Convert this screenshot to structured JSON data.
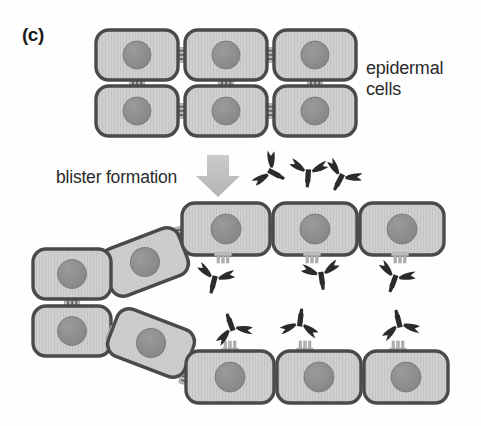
{
  "figure": {
    "panel_label": "(c)",
    "labels": {
      "epidermal_cells_line1": "epidermal",
      "epidermal_cells_line2": "cells",
      "blister_formation": "blister formation"
    },
    "colors": {
      "cell_fill": "#c9c9c9",
      "cell_fill_light": "#d4d4d4",
      "cell_border": "#4a4a4a",
      "nucleus": "#8f8f8f",
      "nucleus_border": "#7a7a7a",
      "desmosome": "#b5b5b5",
      "desmosome_stripe": "#6e6e6e",
      "antibody": "#2b2b2b",
      "arrow": "#c0c0c0",
      "text": "#2a2a2a",
      "background": "#ffffff"
    },
    "arrow": {
      "name": "blister-formation-arrow",
      "direction": "down"
    },
    "intact_cells": [
      {
        "id": "top-row1-cell1",
        "x": 96,
        "y": 30,
        "w": 82,
        "h": 50,
        "rot": 0
      },
      {
        "id": "top-row1-cell2",
        "x": 185,
        "y": 30,
        "w": 82,
        "h": 50,
        "rot": 0
      },
      {
        "id": "top-row1-cell3",
        "x": 274,
        "y": 30,
        "w": 82,
        "h": 50,
        "rot": 0
      },
      {
        "id": "top-row2-cell1",
        "x": 96,
        "y": 86,
        "w": 82,
        "h": 50,
        "rot": 0
      },
      {
        "id": "top-row2-cell2",
        "x": 185,
        "y": 86,
        "w": 82,
        "h": 50,
        "rot": 0
      },
      {
        "id": "top-row2-cell3",
        "x": 274,
        "y": 86,
        "w": 82,
        "h": 50,
        "rot": 0
      }
    ],
    "blister_upper_cells": [
      {
        "id": "upper-tilt-cell",
        "x": 104,
        "y": 237,
        "w": 82,
        "h": 50,
        "rot": -21
      },
      {
        "id": "upper-flat-cell1",
        "x": 182,
        "y": 203,
        "w": 88,
        "h": 52,
        "rot": 0
      },
      {
        "id": "upper-flat-cell2",
        "x": 273,
        "y": 203,
        "w": 84,
        "h": 52,
        "rot": 0
      },
      {
        "id": "upper-flat-cell3",
        "x": 360,
        "y": 203,
        "w": 84,
        "h": 52,
        "rot": 0
      }
    ],
    "blister_left_cells": [
      {
        "id": "left-upper-cell",
        "x": 33,
        "y": 249,
        "w": 78,
        "h": 50,
        "rot": 0
      },
      {
        "id": "left-lower-cell",
        "x": 33,
        "y": 306,
        "w": 78,
        "h": 50,
        "rot": 0
      }
    ],
    "blister_lower_cells": [
      {
        "id": "lower-tilt-cell",
        "x": 110,
        "y": 318,
        "w": 82,
        "h": 50,
        "rot": 21
      },
      {
        "id": "lower-flat-cell1",
        "x": 186,
        "y": 351,
        "w": 88,
        "h": 52,
        "rot": 0
      },
      {
        "id": "lower-flat-cell2",
        "x": 277,
        "y": 351,
        "w": 84,
        "h": 52,
        "rot": 0
      },
      {
        "id": "lower-flat-cell3",
        "x": 364,
        "y": 351,
        "w": 84,
        "h": 52,
        "rot": 0
      }
    ],
    "free_antibodies": [
      {
        "id": "free-antibody-1",
        "x": 266,
        "y": 172,
        "rot": -62
      },
      {
        "id": "free-antibody-2",
        "x": 305,
        "y": 168,
        "rot": 6
      },
      {
        "id": "free-antibody-3",
        "x": 340,
        "y": 172,
        "rot": 28
      }
    ],
    "bound_antibodies_upper": [
      {
        "id": "bound-antibody-upper-1",
        "x": 212,
        "y": 276,
        "rot": 14
      },
      {
        "id": "bound-antibody-upper-2",
        "x": 318,
        "y": 272,
        "rot": -8
      },
      {
        "id": "bound-antibody-upper-3",
        "x": 395,
        "y": 274,
        "rot": 18
      }
    ],
    "bound_antibodies_lower": [
      {
        "id": "bound-antibody-lower-1",
        "x": 234,
        "y": 330,
        "rot": 160
      },
      {
        "id": "bound-antibody-lower-2",
        "x": 300,
        "y": 327,
        "rot": 186
      },
      {
        "id": "bound-antibody-lower-3",
        "x": 400,
        "y": 327,
        "rot": 166
      }
    ],
    "desmosomes_intact": [
      {
        "id": "desmosome-h-1",
        "x": 181,
        "y": 55,
        "rot": 0
      },
      {
        "id": "desmosome-h-2",
        "x": 270,
        "y": 55,
        "rot": 0
      },
      {
        "id": "desmosome-h-3",
        "x": 181,
        "y": 111,
        "rot": 0
      },
      {
        "id": "desmosome-h-4",
        "x": 270,
        "y": 111,
        "rot": 0
      },
      {
        "id": "desmosome-v-1",
        "x": 137,
        "y": 83,
        "rot": 90
      },
      {
        "id": "desmosome-v-2",
        "x": 226,
        "y": 83,
        "rot": 90
      },
      {
        "id": "desmosome-v-3",
        "x": 315,
        "y": 83,
        "rot": 90
      }
    ]
  }
}
